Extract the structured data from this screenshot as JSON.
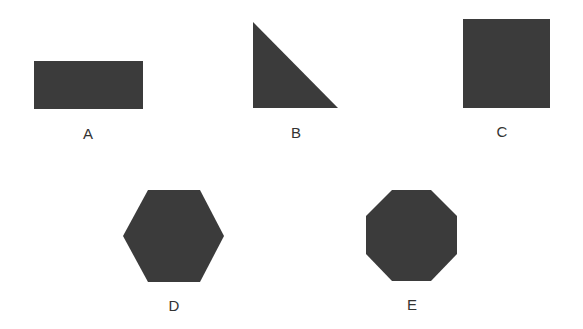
{
  "diagram": {
    "fill_color": "#3b3b3b",
    "label_color": "#333333",
    "shapes": [
      {
        "id": "A",
        "label": "A",
        "type": "rectangle"
      },
      {
        "id": "B",
        "label": "B",
        "type": "right-triangle"
      },
      {
        "id": "C",
        "label": "C",
        "type": "square"
      },
      {
        "id": "D",
        "label": "D",
        "type": "hexagon"
      },
      {
        "id": "E",
        "label": "E",
        "type": "octagon"
      }
    ]
  }
}
